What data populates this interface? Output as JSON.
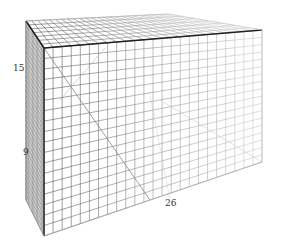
{
  "diagram": {
    "type": "3d-wireframe-grid-box",
    "colors": {
      "background": "#ffffff",
      "front_dark": "#222222",
      "grid_near": "#555555",
      "grid_far": "#c8c8c8",
      "label": "#333333"
    },
    "corners": {
      "top_back_left": [
        26,
        21
      ],
      "top_front_left": [
        44,
        48
      ],
      "top_back_right": [
        168,
        14
      ],
      "top_front_right": [
        262,
        30
      ],
      "bottom_back_left": [
        26,
        200
      ],
      "bottom_front_left": [
        44,
        236
      ],
      "bottom_front_right": [
        262,
        162
      ]
    },
    "grid_divisions": {
      "front_columns": 24,
      "front_rows": 18,
      "top_depth": 7,
      "side_depth": 7
    },
    "axis_labels": [
      {
        "text": "15",
        "x": 13,
        "y": 69
      },
      {
        "text": "9",
        "x": 23,
        "y": 153
      },
      {
        "text": "26",
        "x": 165,
        "y": 199
      }
    ]
  }
}
